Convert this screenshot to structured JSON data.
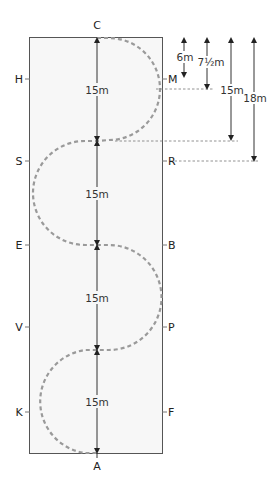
{
  "diagram": {
    "colors": {
      "arena_fill": "#f7f7f7",
      "arena_border": "#555555",
      "track": "#9a9a9a",
      "arrow": "#222222",
      "guide": "#777777"
    },
    "letters": {
      "top": "C",
      "bottom": "A",
      "left": [
        "H",
        "S",
        "E",
        "V",
        "K"
      ],
      "right": [
        "M",
        "R",
        "B",
        "P",
        "F"
      ]
    },
    "center_measurements": [
      "15m",
      "15m",
      "15m",
      "15m"
    ],
    "side_measurements": [
      {
        "label": "6m",
        "to": "M"
      },
      {
        "label": "7½m",
        "to": "first loop apex"
      },
      {
        "label": "15m",
        "to": "first centerline crossing"
      },
      {
        "label": "18m",
        "to": "R"
      }
    ]
  }
}
